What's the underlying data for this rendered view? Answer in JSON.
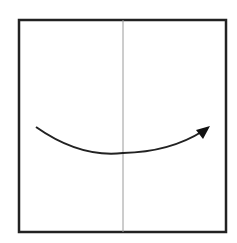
{
  "diagram": {
    "type": "origami-fold-step",
    "colors": {
      "background": "#ffffff",
      "paper_outline": "#222222",
      "crease_line": "#9a9a9a",
      "arrow": "#222222"
    },
    "paper": {
      "x": 19,
      "y": 20,
      "width": 207,
      "height": 212,
      "stroke_width": 2.5
    },
    "crease": {
      "x": 123,
      "y1": 20,
      "y2": 232,
      "stroke_width": 1
    },
    "arrow": {
      "start": [
        36,
        127
      ],
      "control": [
        78,
        160,
        123,
        153
      ],
      "end": [
        203,
        131
      ],
      "tip": [
        210,
        126
      ],
      "direction": "left-to-right",
      "stroke_width": 2
    }
  }
}
